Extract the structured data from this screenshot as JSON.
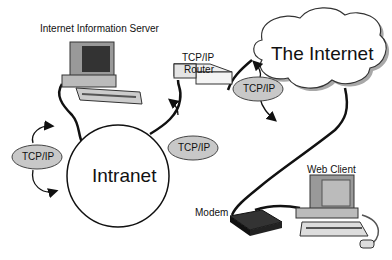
{
  "diagram": {
    "nodes": {
      "server": {
        "label": "Internet Information Server"
      },
      "router": {
        "label_line1": "TCP/IP",
        "label_line2": "Router"
      },
      "internet": {
        "label": "The Internet"
      },
      "intranet": {
        "label": "Intranet"
      },
      "client": {
        "label": "Web Client"
      },
      "modem": {
        "label": "Modem"
      }
    },
    "protocol_badges": [
      {
        "label": "TCP/IP",
        "position": "left of intranet"
      },
      {
        "label": "TCP/IP",
        "position": "between intranet and router"
      },
      {
        "label": "TCP/IP",
        "position": "between router and internet"
      }
    ],
    "colors": {
      "badge_fill": "#c8c8c8",
      "line": "#111111",
      "cloud_shadow": "#a8a8a8"
    }
  }
}
